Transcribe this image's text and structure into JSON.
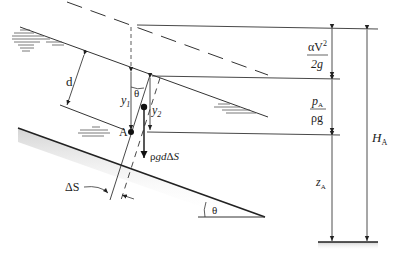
{
  "diagram": {
    "type": "open-channel energy diagram on sloped bed",
    "labels": {
      "depth": "d",
      "y1": "y",
      "y1_sub": "1",
      "y2": "y",
      "y2_sub": "2",
      "theta_top": "θ",
      "theta_bottom": "θ",
      "point": "A",
      "weight": "ρgdΔS",
      "weight_rho": "ρ",
      "weight_g": "g",
      "weight_d": "d",
      "weight_delta": "Δ",
      "weight_S": "S",
      "delta_s": "ΔS",
      "velocity_head_num": "αV",
      "velocity_head_exp": "2",
      "velocity_head_den": "2g",
      "pressure_head_num": "p",
      "pressure_head_num_sub": "A",
      "pressure_head_den": "ρg",
      "elevation": "z",
      "elevation_sub": "A",
      "total_head": "H",
      "total_head_sub": "A"
    },
    "lines": {
      "energy_grade_line": "dashed",
      "water_surface": "solid",
      "channel_bed": "solid, shaded",
      "datum": "solid, shaded"
    },
    "colors": {
      "line": "#333333",
      "shade": "#d8d8d8",
      "water_hatch": "#555555"
    }
  }
}
